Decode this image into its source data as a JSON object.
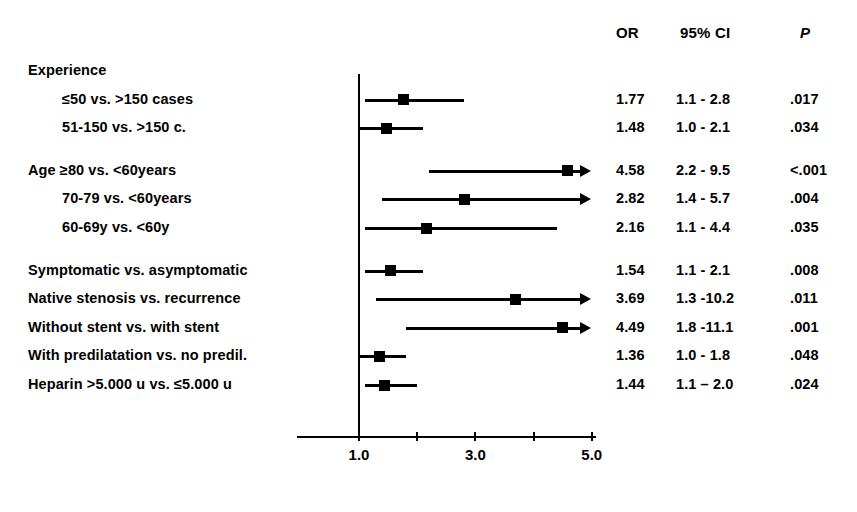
{
  "figure": {
    "type": "forest-plot",
    "headers": {
      "or": "OR",
      "ci": "95% CI",
      "p": "P"
    },
    "axis": {
      "ticks": [
        1.0,
        2.0,
        3.0,
        4.0,
        5.0
      ],
      "tick_labels": [
        "1.0",
        "",
        "3.0",
        "",
        "5.0"
      ],
      "reference_value": 1.0,
      "range": [
        0.6,
        5.2
      ],
      "scale": "linear"
    }
  },
  "chart_data": {
    "type": "forest",
    "title": "",
    "xlabel": "",
    "ylabel": "",
    "xlim": [
      0.6,
      5.2
    ],
    "grid": false,
    "legend": "none",
    "reference_line": 1.0,
    "columns": [
      "OR",
      "95% CI",
      "P"
    ],
    "rows": [
      {
        "kind": "group-header",
        "label": "Experience",
        "indent": 0
      },
      {
        "kind": "data",
        "label": "≤50 vs. >150 cases",
        "indent": 1,
        "or": 1.77,
        "or_text": "1.77",
        "ci_low": 1.1,
        "ci_high": 2.8,
        "ci_text": "1.1 - 2.8",
        "p_text": ".017",
        "truncated_right": false
      },
      {
        "kind": "data",
        "label": "51-150 vs. >150 c.",
        "indent": 1,
        "or": 1.48,
        "or_text": "1.48",
        "ci_low": 1.0,
        "ci_high": 2.1,
        "ci_text": "1.0 - 2.1",
        "p_text": ".034",
        "truncated_right": false
      },
      {
        "kind": "spacer",
        "label": "",
        "indent": 0
      },
      {
        "kind": "data",
        "label": "Age  ≥80 vs. <60years",
        "indent": 0,
        "or": 4.58,
        "or_text": "4.58",
        "ci_low": 2.2,
        "ci_high": 9.5,
        "ci_text": "2.2 - 9.5",
        "p_text": "<.001",
        "truncated_right": true
      },
      {
        "kind": "data",
        "label": "70-79 vs. <60years",
        "indent": 1,
        "or": 2.82,
        "or_text": "2.82",
        "ci_low": 1.4,
        "ci_high": 5.7,
        "ci_text": "1.4 - 5.7",
        "p_text": ".004",
        "truncated_right": true
      },
      {
        "kind": "data",
        "label": "60-69y vs. <60y",
        "indent": 1,
        "or": 2.16,
        "or_text": "2.16",
        "ci_low": 1.1,
        "ci_high": 4.4,
        "ci_text": "1.1 - 4.4",
        "p_text": ".035",
        "truncated_right": false
      },
      {
        "kind": "spacer",
        "label": "",
        "indent": 0
      },
      {
        "kind": "data",
        "label": "Symptomatic vs. asymptomatic",
        "indent": 0,
        "or": 1.54,
        "or_text": "1.54",
        "ci_low": 1.1,
        "ci_high": 2.1,
        "ci_text": "1.1 - 2.1",
        "p_text": ".008",
        "truncated_right": false
      },
      {
        "kind": "data",
        "label": "Native stenosis vs. recurrence",
        "indent": 0,
        "or": 3.69,
        "or_text": "3.69",
        "ci_low": 1.3,
        "ci_high": 10.2,
        "ci_text": "1.3 -10.2",
        "p_text": ".011",
        "truncated_right": true
      },
      {
        "kind": "data",
        "label": "Without stent vs. with stent",
        "indent": 0,
        "or": 4.49,
        "or_text": "4.49",
        "ci_low": 1.8,
        "ci_high": 11.1,
        "ci_text": "1.8 -11.1",
        "p_text": ".001",
        "truncated_right": true
      },
      {
        "kind": "data",
        "label": "With predilatation vs. no predil.",
        "indent": 0,
        "or": 1.36,
        "or_text": "1.36",
        "ci_low": 1.0,
        "ci_high": 1.8,
        "ci_text": "1.0 - 1.8",
        "p_text": ".048",
        "truncated_right": false
      },
      {
        "kind": "data",
        "label": "Heparin >5.000 u vs. ≤5.000 u",
        "indent": 0,
        "or": 1.44,
        "or_text": "1.44",
        "ci_low": 1.1,
        "ci_high": 2.0,
        "ci_text": "1.1 – 2.0",
        "p_text": ".024",
        "truncated_right": false
      }
    ]
  },
  "style": {
    "marker_color": "#000000",
    "line_color": "#000000",
    "background": "#ffffff"
  }
}
